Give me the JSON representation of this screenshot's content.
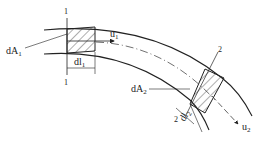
{
  "diagram": {
    "type": "streamtube-flow-element",
    "sections": [
      {
        "id": "section-1",
        "marker_top": "1",
        "marker_bottom": "1",
        "area_label": "dA",
        "area_sub": "1",
        "length_label": "dl",
        "length_sub": "1",
        "velocity_label": "u",
        "velocity_sub": "1"
      },
      {
        "id": "section-2",
        "marker_top": "2",
        "marker_bottom": "2",
        "area_label": "dA",
        "area_sub": "2",
        "length_label": "dl",
        "length_sub": "2",
        "velocity_label": "u",
        "velocity_sub": "2"
      }
    ],
    "colors": {
      "line": "#222222",
      "background": "#ffffff"
    }
  }
}
